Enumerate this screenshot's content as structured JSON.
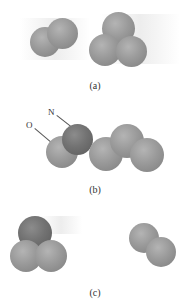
{
  "figure": {
    "panels": [
      {
        "id": "a",
        "caption": "(a)",
        "molecules": [
          "diatomic (2 light atoms)",
          "triatomic cluster (3 light atoms)"
        ]
      },
      {
        "id": "b",
        "caption": "(b)",
        "molecules": [
          "NO + trimer chain"
        ],
        "labels": [
          "O",
          "N"
        ]
      },
      {
        "id": "c",
        "caption": "(c)",
        "molecules": [
          "triatomic (1 dark + 2 light atoms)",
          "diatomic (2 light atoms)"
        ]
      }
    ]
  }
}
